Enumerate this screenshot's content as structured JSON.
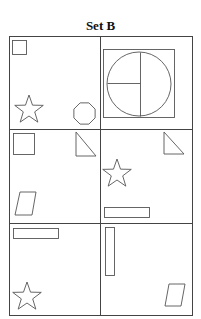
{
  "title": "Set B",
  "colors": {
    "stroke": "#555555",
    "grid": "#444444",
    "background": "#ffffff"
  },
  "grid": {
    "rows": 3,
    "cols": 2,
    "x": [
      9,
      100,
      192
    ],
    "y": [
      36,
      129,
      223,
      315
    ]
  },
  "cells": [
    {
      "row": 0,
      "col": 0,
      "shapes": [
        {
          "type": "square",
          "x": 12,
          "y": 40,
          "w": 14,
          "h": 14
        },
        {
          "type": "star",
          "cx": 29,
          "cy": 110,
          "r": 15
        },
        {
          "type": "octagon",
          "cx": 84.5,
          "cy": 113.5,
          "r": 11.5
        }
      ]
    },
    {
      "row": 0,
      "col": 1,
      "shapes": [
        {
          "type": "square",
          "x": 103,
          "y": 49,
          "w": 71,
          "h": 68
        },
        {
          "type": "circle",
          "cx": 139,
          "cy": 84,
          "r": 32
        },
        {
          "type": "line",
          "x1": 140,
          "y1": 52,
          "x2": 140,
          "y2": 116
        },
        {
          "type": "line",
          "x1": 107,
          "y1": 83,
          "x2": 140,
          "y2": 83
        }
      ]
    },
    {
      "row": 1,
      "col": 0,
      "shapes": [
        {
          "type": "square",
          "x": 13,
          "y": 133,
          "w": 21,
          "h": 21
        },
        {
          "type": "right-triangle",
          "points": "76,132 76,156 96,156"
        },
        {
          "type": "parallelogram",
          "points": "20,192 36,192 32,215 15,215"
        }
      ]
    },
    {
      "row": 1,
      "col": 1,
      "shapes": [
        {
          "type": "right-triangle",
          "points": "164,132 164,154 184,154"
        },
        {
          "type": "star",
          "cx": 117,
          "cy": 174,
          "r": 15
        },
        {
          "type": "rectangle",
          "x": 104,
          "y": 207,
          "w": 45,
          "h": 10
        }
      ]
    },
    {
      "row": 2,
      "col": 0,
      "shapes": [
        {
          "type": "rectangle",
          "x": 13,
          "y": 228,
          "w": 45,
          "h": 10
        },
        {
          "type": "star",
          "cx": 27,
          "cy": 297,
          "r": 15
        }
      ]
    },
    {
      "row": 2,
      "col": 1,
      "shapes": [
        {
          "type": "rectangle",
          "x": 105,
          "y": 227,
          "w": 9,
          "h": 48
        },
        {
          "type": "parallelogram",
          "points": "169,284 185,284 181,306 165,306"
        }
      ]
    }
  ]
}
